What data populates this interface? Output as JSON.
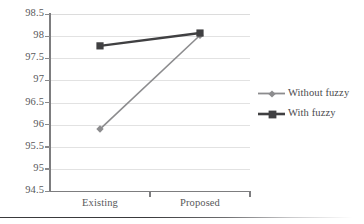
{
  "chart_data": {
    "type": "line",
    "title": "",
    "subtitle": "",
    "xlabel": "",
    "ylabel": "",
    "categories": [
      "Existing",
      "Proposed"
    ],
    "series": [
      {
        "name": "Without fuzzy",
        "values": [
          95.9,
          98.02
        ],
        "color": "#8c8c8e",
        "marker": "diamond",
        "line_width": 1.6
      },
      {
        "name": "With fuzzy",
        "values": [
          97.78,
          98.07
        ],
        "color": "#404042",
        "marker": "square",
        "line_width": 2.4
      }
    ],
    "ylim": [
      94.5,
      98.5
    ],
    "ytick_step": 0.5,
    "ytick_labels": [
      "98.5",
      "98",
      "97.5",
      "97",
      "96.5",
      "96",
      "95.5",
      "95",
      "94.5"
    ],
    "ytick_values": [
      98.5,
      98,
      97.5,
      97,
      96.5,
      96,
      95.5,
      95,
      94.5
    ],
    "grid": true,
    "grid_color": "#e2e2e2",
    "axis_color": "#7d7d7f",
    "text_color": "#58585a",
    "legend_position": "right",
    "legend_entries": [
      "Without fuzzy",
      "With fuzzy"
    ],
    "background": "#ffffff"
  },
  "figure": {
    "legend": {
      "entries": [
        {
          "label": "Without fuzzy",
          "marker": "diamond-marker-icon"
        },
        {
          "label": "With fuzzy",
          "marker": "square-marker-icon"
        }
      ]
    },
    "bottom_rule": ""
  }
}
